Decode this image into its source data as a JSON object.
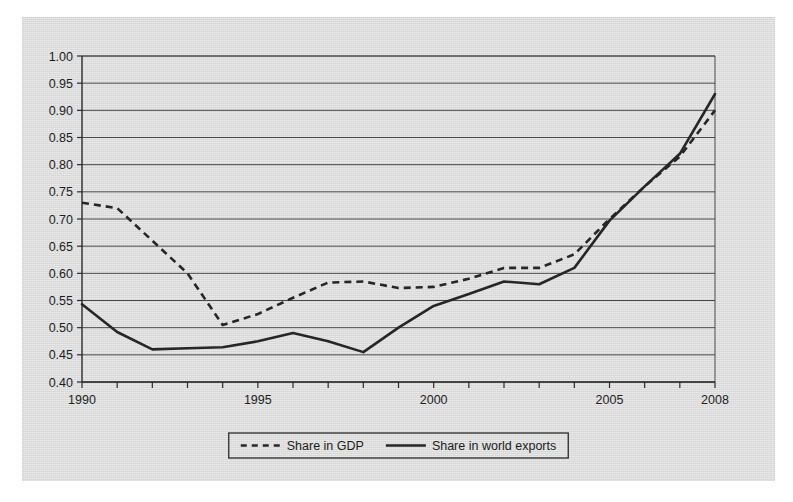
{
  "chart_data": {
    "type": "line",
    "title": "",
    "subtitle": "",
    "xlabel": "",
    "ylabel": "",
    "x": [
      1990,
      1991,
      1992,
      1993,
      1994,
      1995,
      1996,
      1997,
      1998,
      1999,
      2000,
      2001,
      2002,
      2003,
      2004,
      2005,
      2006,
      2007,
      2008
    ],
    "xlim": [
      1990,
      2008
    ],
    "ylim": [
      0.4,
      1.0
    ],
    "ytick_values": [
      0.4,
      0.45,
      0.5,
      0.55,
      0.6,
      0.65,
      0.7,
      0.75,
      0.8,
      0.85,
      0.9,
      0.95,
      1.0
    ],
    "ytick_labels": [
      "0.40",
      "0.45",
      "0.50",
      "0.55",
      "0.60",
      "0.65",
      "0.70",
      "0.75",
      "0.80",
      "0.85",
      "0.90",
      "0.95",
      "1.00"
    ],
    "xtick_values": [
      1990,
      1991,
      1992,
      1993,
      1994,
      1995,
      1996,
      1997,
      1998,
      1999,
      2000,
      2001,
      2002,
      2003,
      2004,
      2005,
      2006,
      2007,
      2008
    ],
    "xtick_labels_shown": [
      {
        "value": 1990,
        "label": "1990"
      },
      {
        "value": 1995,
        "label": "1995"
      },
      {
        "value": 2000,
        "label": "2000"
      },
      {
        "value": 2005,
        "label": "2005"
      },
      {
        "value": 2008,
        "label": "2008"
      }
    ],
    "grid": "horizontal",
    "legend_position": "bottom-center",
    "series": [
      {
        "name": "Share in GDP",
        "style": "dashed",
        "color": "#262626",
        "values": [
          0.73,
          0.72,
          0.66,
          0.6,
          0.505,
          0.525,
          0.555,
          0.583,
          0.585,
          0.573,
          0.575,
          0.59,
          0.61,
          0.61,
          0.635,
          0.7,
          0.76,
          0.815,
          0.9
        ]
      },
      {
        "name": "Share in world exports",
        "style": "solid",
        "color": "#262626",
        "values": [
          0.543,
          0.492,
          0.46,
          0.462,
          0.464,
          0.475,
          0.49,
          0.475,
          0.455,
          0.5,
          0.54,
          0.562,
          0.585,
          0.58,
          0.61,
          0.697,
          0.76,
          0.82,
          0.93
        ]
      }
    ]
  },
  "legend": {
    "entries": [
      {
        "label": "Share in GDP",
        "style": "dashed"
      },
      {
        "label": "Share in world exports",
        "style": "solid"
      }
    ]
  },
  "colors": {
    "paper_background": "#dcdcdc",
    "page_background": "#ffffff",
    "ink": "#262626",
    "gridline": "#4a4a4a"
  }
}
